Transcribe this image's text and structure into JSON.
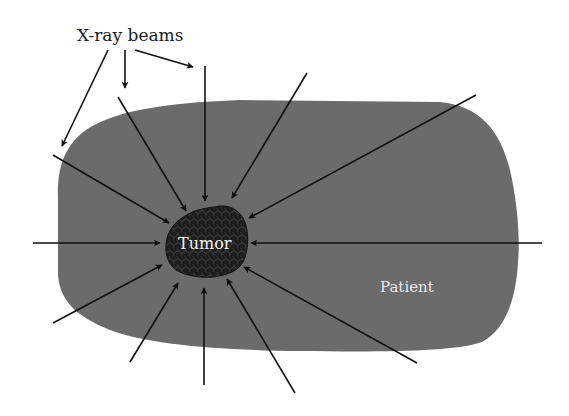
{
  "title_label": "X-ray beams",
  "patient": {
    "label": "Patient",
    "fill": "#6b6b6b"
  },
  "tumor": {
    "label": "Tumor",
    "fill": "#1f1f1f",
    "texture": "#3a3a3a"
  },
  "colors": {
    "background": "#ffffff",
    "arrow": "#111111",
    "label_on_dark": "#f2f2f2",
    "label_text": "#1a1a1a"
  },
  "label_arrows": [
    {
      "id": "label-arrow-1",
      "from": [
        108,
        50
      ],
      "to": [
        62,
        146
      ]
    },
    {
      "id": "label-arrow-2",
      "from": [
        125,
        50
      ],
      "to": [
        125,
        88
      ]
    },
    {
      "id": "label-arrow-3",
      "from": [
        135,
        50
      ],
      "to": [
        193,
        67
      ]
    }
  ],
  "beams": [
    {
      "id": "beam-top",
      "from": [
        205,
        66
      ],
      "to": [
        205,
        201
      ]
    },
    {
      "id": "beam-top-right",
      "from": [
        307,
        73
      ],
      "to": [
        232,
        198
      ]
    },
    {
      "id": "beam-right-upper",
      "from": [
        476,
        95
      ],
      "to": [
        249,
        218
      ]
    },
    {
      "id": "beam-right",
      "from": [
        542,
        243
      ],
      "to": [
        251,
        243
      ]
    },
    {
      "id": "beam-right-lower",
      "from": [
        417,
        363
      ],
      "to": [
        244,
        267
      ]
    },
    {
      "id": "beam-bottom-right",
      "from": [
        295,
        393
      ],
      "to": [
        227,
        279
      ]
    },
    {
      "id": "beam-bottom",
      "from": [
        204,
        385
      ],
      "to": [
        204,
        288
      ]
    },
    {
      "id": "beam-bottom-left",
      "from": [
        130,
        362
      ],
      "to": [
        178,
        283
      ]
    },
    {
      "id": "beam-left-lower",
      "from": [
        53,
        323
      ],
      "to": [
        162,
        265
      ]
    },
    {
      "id": "beam-left",
      "from": [
        33,
        243
      ],
      "to": [
        160,
        243
      ]
    },
    {
      "id": "beam-left-upper",
      "from": [
        53,
        155
      ],
      "to": [
        169,
        223
      ]
    },
    {
      "id": "beam-upper-left",
      "from": [
        118,
        97
      ],
      "to": [
        186,
        211
      ]
    }
  ]
}
